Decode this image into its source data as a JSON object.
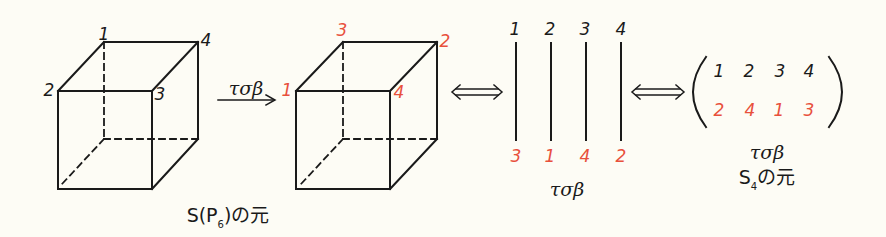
{
  "cube_original": {
    "caption": "S(P",
    "caption_sub": "6",
    "caption_tail": ")の元",
    "vertex_labels": [
      {
        "label": "1",
        "color": "#1a1a1a"
      },
      {
        "label": "2",
        "color": "#1a1a1a"
      },
      {
        "label": "3",
        "color": "#1a1a1a"
      },
      {
        "label": "4",
        "color": "#1a1a1a"
      }
    ]
  },
  "transform_arrow": {
    "label": "τσβ"
  },
  "cube_transformed": {
    "vertex_labels": [
      {
        "label": "3",
        "color": "#e8503c"
      },
      {
        "label": "1",
        "color": "#e8503c"
      },
      {
        "label": "4",
        "color": "#e8503c"
      },
      {
        "label": "2",
        "color": "#e8503c"
      }
    ]
  },
  "equivalence_symbol": "⟺",
  "strand_diagram": {
    "top": [
      "1",
      "2",
      "3",
      "4"
    ],
    "bottom": [
      "3",
      "1",
      "4",
      "2"
    ],
    "caption": "τσβ"
  },
  "permutation_matrix": {
    "top_row": [
      "1",
      "2",
      "3",
      "4"
    ],
    "bottom_row": [
      "2",
      "4",
      "1",
      "3"
    ],
    "caption_line1": "τσβ",
    "caption_line2_main": "S",
    "caption_line2_sub": "4",
    "caption_line2_tail": "の元"
  },
  "colors": {
    "ink": "#1a1a1a",
    "accent": "#e8503c",
    "background": "#fdfcf5"
  }
}
